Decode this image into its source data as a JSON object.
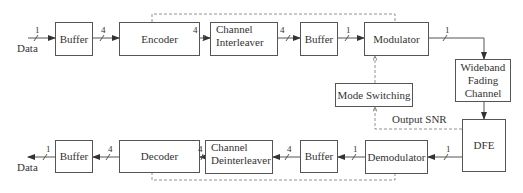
{
  "blocks": {
    "tx_buffer_in": "Buffer",
    "encoder": "Encoder",
    "channel_interleaver_line1": "Channel",
    "channel_interleaver_line2": "Interleaver",
    "tx_buffer_out": "Buffer",
    "modulator": "Modulator",
    "mode_switching": "Mode Switching",
    "wideband_line1": "Wideband",
    "wideband_line2": "Fading",
    "wideband_line3": "Channel",
    "dfe": "DFE",
    "demodulator": "Demodulator",
    "rx_buffer_in": "Buffer",
    "channel_deinterleaver_line1": "Channel",
    "channel_deinterleaver_line2": "Deinterleaver",
    "decoder": "Decoder",
    "rx_buffer_out": "Buffer"
  },
  "labels": {
    "data_in": "Data",
    "data_out": "Data",
    "output_snr": "Output SNR"
  },
  "bus_widths": {
    "data_in": "1",
    "buffer_to_encoder": "4",
    "encoder_to_interleaver": "4",
    "interleaver_to_buffer": "4",
    "buffer_to_modulator": "1",
    "modulator_to_channel": "1",
    "dfe_to_demodulator": "1",
    "demodulator_to_buffer": "1",
    "buffer_to_deinterleaver": "4",
    "deinterleaver_to_decoder": "4",
    "decoder_to_buffer": "4",
    "data_out": "1"
  }
}
